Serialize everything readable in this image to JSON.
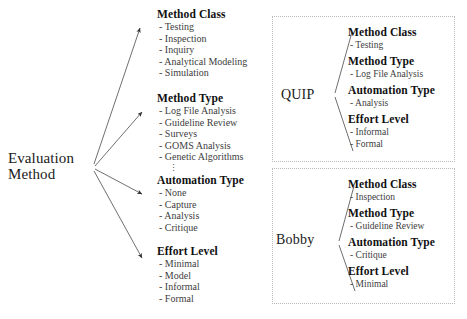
{
  "diagram": {
    "root": {
      "label_line1": "Evaluation",
      "label_line2": "Method"
    },
    "facets": [
      {
        "id": "method-class",
        "heading": "Method Class",
        "items": [
          "- Testing",
          "- Inspection",
          "- Inquiry",
          "- Analytical Modeling",
          "- Simulation"
        ],
        "ellipsis": ""
      },
      {
        "id": "method-type",
        "heading": "Method Type",
        "items": [
          "- Log File Analysis",
          "- Guideline Review",
          "- Surveys",
          "- GOMS Analysis",
          "- Genetic Algorithms"
        ],
        "ellipsis": "⋮"
      },
      {
        "id": "automation-type",
        "heading": "Automation Type",
        "items": [
          "- None",
          "- Capture",
          "- Analysis",
          "- Critique"
        ],
        "ellipsis": ""
      },
      {
        "id": "effort-level",
        "heading": "Effort Level",
        "items": [
          "- Minimal",
          "- Model",
          "- Informal",
          "- Formal"
        ],
        "ellipsis": ""
      }
    ],
    "examples": [
      {
        "id": "quip",
        "name": "QUIP",
        "groups": [
          {
            "heading": "Method Class",
            "items": [
              "- Testing"
            ]
          },
          {
            "heading": "Method Type",
            "items": [
              "- Log File Analysis"
            ]
          },
          {
            "heading": "Automation Type",
            "items": [
              "- Analysis"
            ]
          },
          {
            "heading": "Effort Level",
            "items": [
              "- Informal",
              "- Formal"
            ]
          }
        ]
      },
      {
        "id": "bobby",
        "name": "Bobby",
        "groups": [
          {
            "heading": "Method Class",
            "items": [
              "- Inspection"
            ]
          },
          {
            "heading": "Method Type",
            "items": [
              "- Guideline Review"
            ]
          },
          {
            "heading": "Automation Type",
            "items": [
              "- Critique"
            ]
          },
          {
            "heading": "Effort Level",
            "items": [
              "- Minimal"
            ]
          }
        ]
      }
    ],
    "colors": {
      "line": "#444444",
      "box_border": "#b9b9b9",
      "heading_text": "#111111",
      "item_text": "#3d3d3d",
      "background": "#ffffff"
    }
  }
}
